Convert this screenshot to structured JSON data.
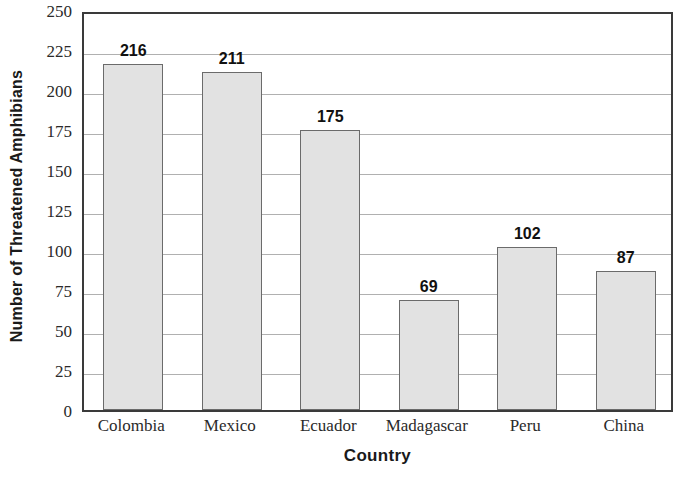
{
  "chart_data": {
    "type": "bar",
    "title": "",
    "xlabel": "Country",
    "ylabel": "Number of Threatened Amphibians",
    "categories": [
      "Colombia",
      "Mexico",
      "Ecuador",
      "Madagascar",
      "Peru",
      "China"
    ],
    "values": [
      216,
      211,
      175,
      69,
      102,
      87
    ],
    "value_labels": [
      "216",
      "211",
      "175",
      "69",
      "102",
      "87"
    ],
    "ylim": [
      0,
      250
    ],
    "ytick_step": 25,
    "yticks": [
      0,
      25,
      50,
      75,
      100,
      125,
      150,
      175,
      200,
      225,
      250
    ],
    "ytick_labels": [
      "0",
      "25",
      "50",
      "75",
      "100",
      "125",
      "150",
      "175",
      "200",
      "225",
      "250"
    ],
    "grid": true,
    "grid_axis": "y",
    "legend": false,
    "legend_position": "none",
    "bar_fill_color": "#e2e2e2",
    "bar_edge_color": "#6b6b6b",
    "grid_color": "#b0b0b0",
    "axis_color": "#3a3a3a",
    "text_color": "#1a1a1a"
  }
}
